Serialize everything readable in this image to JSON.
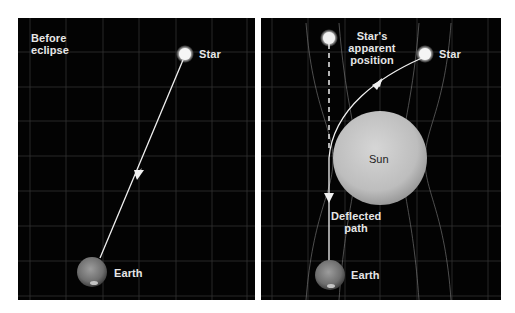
{
  "diagram": {
    "panels": [
      {
        "id": "before",
        "title": "Before eclipse",
        "title_lines": [
          "Before",
          "eclipse"
        ],
        "labels": {
          "star": "Star",
          "earth": "Earth"
        }
      },
      {
        "id": "during",
        "labels": {
          "apparent_star": "Star's apparent position",
          "apparent_star_lines": [
            "Star's",
            "apparent",
            "position"
          ],
          "star": "Star",
          "sun": "Sun",
          "deflected_path": "Deflected path",
          "deflected_path_lines": [
            "Deflected",
            "path"
          ],
          "earth": "Earth"
        }
      }
    ],
    "colors": {
      "background": "#030303",
      "grid": "#3a3a3a",
      "light_ray": "#f0f0f0",
      "sun": "#c8c8c8",
      "star": "#eeeeee",
      "earth": "#8a8a8a",
      "label": "#e6e6e6"
    }
  }
}
